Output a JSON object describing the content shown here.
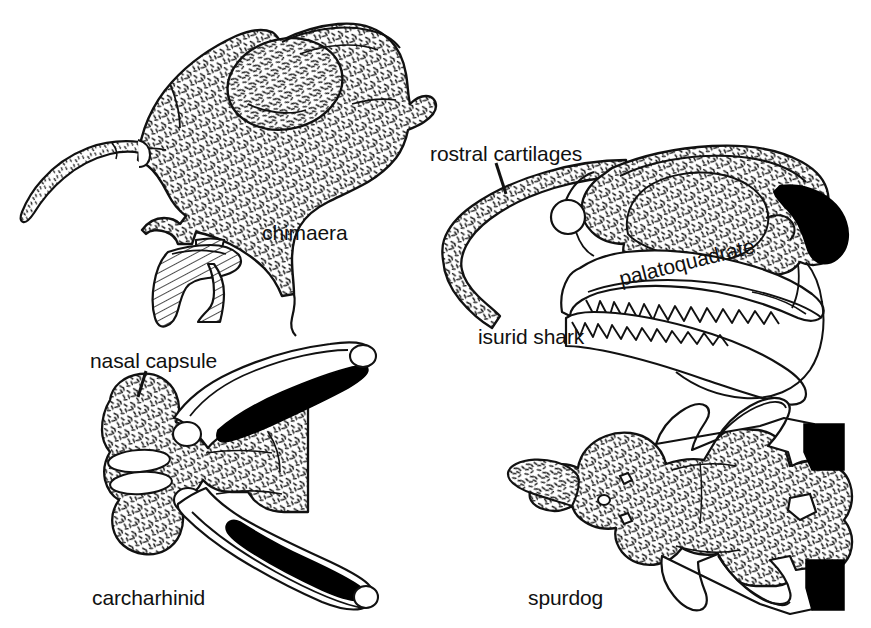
{
  "figure": {
    "type": "comparative-anatomy-line-drawing",
    "background_color": "#ffffff",
    "ink_color": "#111111",
    "fill_black": "#000000",
    "texture": "stipple-dash cartilage shading",
    "width": 871,
    "height": 628
  },
  "panels": [
    {
      "id": "chimaera",
      "label": "chimaera",
      "label_x": 262,
      "label_y": 236,
      "view": "lateral",
      "features": [
        "rostral process",
        "orbit",
        "hatched tooth plates"
      ]
    },
    {
      "id": "isurid-shark",
      "label": "isurid shark",
      "label_x": 478,
      "label_y": 340,
      "view": "lateral",
      "features": [
        "rostral cartilages",
        "palatoquadrate",
        "teeth",
        "black hyomandibula"
      ]
    },
    {
      "id": "carcharhinid",
      "label": "carcharhinid",
      "label_x": 92,
      "label_y": 601,
      "view": "dorsal",
      "features": [
        "nasal capsule",
        "black jaw blades"
      ]
    },
    {
      "id": "spurdog",
      "label": "spurdog",
      "label_x": 528,
      "label_y": 601,
      "view": "dorsal",
      "features": [
        "black jaw blades",
        "foramina"
      ]
    }
  ],
  "callouts": [
    {
      "id": "rostral-cartilages",
      "text": "rostral cartilages",
      "label_x": 430,
      "label_y": 158,
      "leader": {
        "x1": 496,
        "y1": 163,
        "x2": 506,
        "y2": 194
      }
    },
    {
      "id": "palatoquadrate",
      "text": "palatoquadrate",
      "label_x": 622,
      "label_y": 285,
      "rotated": true,
      "rotation_deg": -14
    },
    {
      "id": "nasal-capsule",
      "text": "nasal capsule",
      "label_x": 90,
      "label_y": 365,
      "leader": {
        "x1": 146,
        "y1": 371,
        "x2": 138,
        "y2": 397
      }
    }
  ]
}
